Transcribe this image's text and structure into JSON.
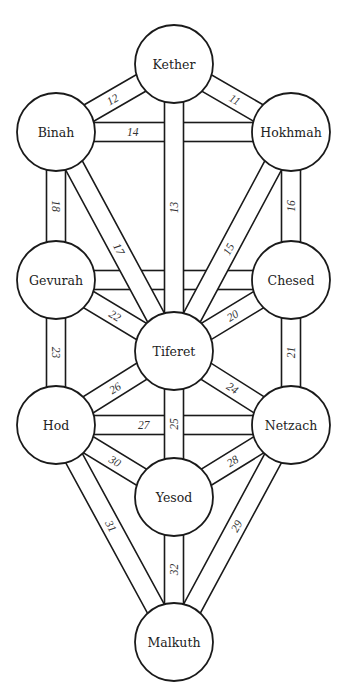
{
  "diagram": {
    "colors": {
      "line": "#1a1a1a",
      "fill": "#ffffff",
      "text": "#222222"
    },
    "node_radius": 39,
    "band_width": 19,
    "nodes": [
      {
        "id": "kether",
        "label": "Kether",
        "x": 174,
        "y": 64
      },
      {
        "id": "binah",
        "label": "Binah",
        "x": 56,
        "y": 132
      },
      {
        "id": "hokhmah",
        "label": "Hokhmah",
        "x": 291,
        "y": 132
      },
      {
        "id": "gevurah",
        "label": "Gevurah",
        "x": 56,
        "y": 280
      },
      {
        "id": "chesed",
        "label": "Chesed",
        "x": 291,
        "y": 280
      },
      {
        "id": "tiferet",
        "label": "Tiferet",
        "x": 174,
        "y": 351
      },
      {
        "id": "hod",
        "label": "Hod",
        "x": 56,
        "y": 425
      },
      {
        "id": "netzach",
        "label": "Netzach",
        "x": 291,
        "y": 425
      },
      {
        "id": "yesod",
        "label": "Yesod",
        "x": 174,
        "y": 497
      },
      {
        "id": "malkuth",
        "label": "Malkuth",
        "x": 174,
        "y": 642
      }
    ],
    "paths": [
      {
        "number": "14",
        "from": "binah",
        "to": "hokhmah",
        "label_t": 0.24,
        "flip": false
      },
      {
        "number": "19",
        "from": "gevurah",
        "to": "chesed",
        "label_t": 0.24,
        "flip": false
      },
      {
        "number": "27",
        "from": "hod",
        "to": "netzach",
        "label_t": 0.31,
        "flip": false
      },
      {
        "number": "18",
        "from": "binah",
        "to": "gevurah",
        "label_t": 0.5,
        "flip": false
      },
      {
        "number": "16",
        "from": "hokhmah",
        "to": "chesed",
        "label_t": 0.5,
        "flip": true
      },
      {
        "number": "23",
        "from": "gevurah",
        "to": "hod",
        "label_t": 0.5,
        "flip": false
      },
      {
        "number": "21",
        "from": "chesed",
        "to": "netzach",
        "label_t": 0.5,
        "flip": true
      },
      {
        "number": "12",
        "from": "binah",
        "to": "kether",
        "label_t": 0.45,
        "flip": false
      },
      {
        "number": "11",
        "from": "kether",
        "to": "hokhmah",
        "label_t": 0.55,
        "flip": false
      },
      {
        "number": "22",
        "from": "gevurah",
        "to": "tiferet",
        "label_t": 0.5,
        "flip": false
      },
      {
        "number": "20",
        "from": "chesed",
        "to": "tiferet",
        "label_t": 0.5,
        "flip": false
      },
      {
        "number": "26",
        "from": "hod",
        "to": "tiferet",
        "label_t": 0.5,
        "flip": false
      },
      {
        "number": "24",
        "from": "tiferet",
        "to": "netzach",
        "label_t": 0.5,
        "flip": false
      },
      {
        "number": "30",
        "from": "hod",
        "to": "yesod",
        "label_t": 0.5,
        "flip": false
      },
      {
        "number": "28",
        "from": "netzach",
        "to": "yesod",
        "label_t": 0.5,
        "flip": false
      },
      {
        "number": "17",
        "from": "binah",
        "to": "tiferet",
        "label_t": 0.55,
        "flip": false
      },
      {
        "number": "15",
        "from": "hokhmah",
        "to": "tiferet",
        "label_t": 0.55,
        "flip": false
      },
      {
        "number": "31",
        "from": "hod",
        "to": "malkuth",
        "label_t": 0.45,
        "flip": false
      },
      {
        "number": "29",
        "from": "netzach",
        "to": "malkuth",
        "label_t": 0.45,
        "flip": false
      },
      {
        "number": "13",
        "from": "kether",
        "to": "tiferet",
        "label_t": 0.5,
        "flip": true
      },
      {
        "number": "25",
        "from": "tiferet",
        "to": "yesod",
        "label_t": 0.5,
        "flip": true
      },
      {
        "number": "32",
        "from": "yesod",
        "to": "malkuth",
        "label_t": 0.5,
        "flip": true
      }
    ]
  }
}
